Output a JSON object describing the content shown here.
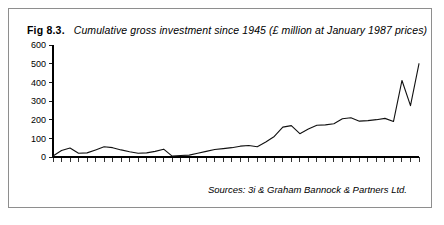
{
  "figure": {
    "label": "Fig 8.3.",
    "caption": "Cumulative gross investment since 1945 (£ million at January 1987 prices)",
    "source_note": "Sources: 3i & Graham Bannock & Partners Ltd."
  },
  "chart_data": {
    "type": "line",
    "title": "Cumulative gross investment since 1945 (£ million at January 1987 prices)",
    "xlabel": "",
    "ylabel": "",
    "ylim": [
      0,
      600
    ],
    "yticks": [
      0,
      100,
      200,
      300,
      400,
      500,
      600
    ],
    "ytick_labels": [
      "0",
      "100",
      "200",
      "300",
      "400",
      "500",
      "600"
    ],
    "xlim": [
      1946,
      1989
    ],
    "xticks": [
      1946,
      1948,
      1950,
      1952,
      1954,
      1956,
      1958,
      1960,
      1962,
      1964,
      1966,
      1968,
      1970,
      1972,
      1974,
      1976,
      1978,
      1980,
      1982,
      1984,
      1986,
      1988
    ],
    "xtick_labels": [
      "1946",
      "1948",
      "1950",
      "1952",
      "1954",
      "1956",
      "1958",
      "1960",
      "1962",
      "1964",
      "1966",
      "1968",
      "1970",
      "1972",
      "1974",
      "1976",
      "1978",
      "1980",
      "1982",
      "1984",
      "1986",
      "1988"
    ],
    "xtick_label_rotation": -90,
    "minor_tick_interval": 1,
    "grid": false,
    "legend": false,
    "line_color": "#111111",
    "x": [
      1946,
      1947,
      1948,
      1949,
      1950,
      1951,
      1952,
      1953,
      1954,
      1955,
      1956,
      1957,
      1958,
      1959,
      1960,
      1961,
      1962,
      1963,
      1964,
      1965,
      1966,
      1967,
      1968,
      1969,
      1970,
      1971,
      1972,
      1973,
      1974,
      1975,
      1976,
      1977,
      1978,
      1979,
      1980,
      1981,
      1982,
      1983,
      1984,
      1985,
      1986,
      1987,
      1988,
      1989
    ],
    "values": [
      5,
      35,
      48,
      20,
      22,
      38,
      55,
      50,
      38,
      28,
      20,
      22,
      30,
      42,
      5,
      8,
      10,
      20,
      30,
      40,
      45,
      50,
      58,
      62,
      55,
      80,
      110,
      160,
      168,
      125,
      150,
      170,
      172,
      178,
      205,
      210,
      192,
      195,
      200,
      207,
      190,
      410,
      275,
      500
    ],
    "series": [
      {
        "name": "Cumulative gross investment",
        "values": [
          5,
          35,
          48,
          20,
          22,
          38,
          55,
          50,
          38,
          28,
          20,
          22,
          30,
          42,
          5,
          8,
          10,
          20,
          30,
          40,
          45,
          50,
          58,
          62,
          55,
          80,
          110,
          160,
          168,
          125,
          150,
          170,
          172,
          178,
          205,
          210,
          192,
          195,
          200,
          207,
          190,
          410,
          275,
          500
        ]
      }
    ],
    "annotations": [
      "Sharp rise from mid-1970s, peaking near 440 in mid-1980s",
      "Flat final segment at approximately 500"
    ]
  }
}
